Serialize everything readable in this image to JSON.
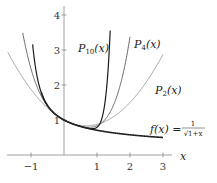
{
  "chart_data": {
    "type": "line",
    "title": "",
    "xlabel": "x",
    "ylabel": "",
    "xlim": [
      -1.7,
      3.1
    ],
    "ylim": [
      0,
      4.3
    ],
    "x_ticks": [
      -1,
      1,
      2,
      3
    ],
    "x_tick_labels": [
      "−1",
      "1",
      "2",
      "3"
    ],
    "y_ticks": [
      1,
      2,
      3,
      4
    ],
    "y_tick_labels": [
      "1",
      "2",
      "3",
      "4"
    ],
    "grid": false,
    "legend": "none (inline curve labels)",
    "series": [
      {
        "name": "f(x) = 1/√(1+x)",
        "kind": "function",
        "domain": [
          -0.69,
          3.0
        ],
        "color": "#222222",
        "width": 1.6
      },
      {
        "name": "P2(x)",
        "kind": "taylor",
        "degree": 2,
        "coefficients": [
          1,
          -0.5,
          0.375
        ],
        "domain": [
          -1.7,
          3.0
        ],
        "color": "#8a8a8a",
        "width": 0.8
      },
      {
        "name": "P4(x)",
        "kind": "taylor",
        "degree": 4,
        "coefficients": [
          1,
          -0.5,
          0.375,
          -0.3125,
          0.2734375
        ],
        "domain": [
          -1.25,
          2.0
        ],
        "color": "#555555",
        "width": 0.9
      },
      {
        "name": "P10(x)",
        "kind": "taylor",
        "degree": 10,
        "coefficients": [
          1,
          -0.5,
          0.375,
          -0.3125,
          0.2734375,
          -0.24609375,
          0.2255859375,
          -0.20947265625,
          0.196380615234375,
          -0.1854705810546875,
          0.17619705200195312
        ],
        "domain": [
          -0.95,
          1.4
        ],
        "color": "#1a1a1a",
        "width": 1.2
      }
    ],
    "annotations": [
      {
        "text_main": "P",
        "sub": "10",
        "arg": "(x)",
        "x": 0.45,
        "y": 3.0
      },
      {
        "text_main": "P",
        "sub": "4",
        "arg": "(x)",
        "x": 1.3,
        "y": 3.15
      },
      {
        "text_main": "P",
        "sub": "2",
        "arg": "(x)",
        "x": 1.95,
        "y": 1.95
      },
      {
        "text_main": "f(x) = ",
        "fraction": {
          "num": "1",
          "den": "√1+x"
        },
        "x": 1.9,
        "y": 0.75
      }
    ]
  },
  "labels": {
    "p10": {
      "main": "P",
      "sub": "10",
      "arg": "(x)"
    },
    "p4": {
      "main": "P",
      "sub": "4",
      "arg": "(x)"
    },
    "p2": {
      "main": "P",
      "sub": "2",
      "arg": "(x)"
    },
    "f": {
      "lhs": "f(x) =",
      "num": "1",
      "den": "√1+x"
    },
    "x_axis": "x"
  },
  "layout": {
    "origin_px": [
      64,
      155
    ],
    "px_per_unit_x": 33,
    "px_per_unit_y": 35
  }
}
